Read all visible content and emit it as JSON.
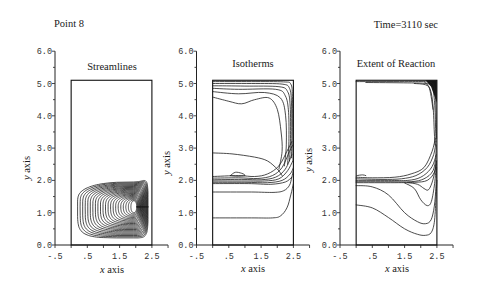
{
  "header": {
    "point_label": "Point 8",
    "time_label": "Time=3110 sec"
  },
  "labels": {
    "x_var": "x",
    "y_var": "y",
    "axis_word": " axis"
  },
  "chart_data": [
    {
      "type": "contour",
      "title": "Streamlines",
      "xlabel": "x axis",
      "ylabel": "y axis",
      "xlim": [
        -0.5,
        3.0
      ],
      "ylim": [
        0,
        6
      ],
      "x_tick_step": 0.5,
      "y_minor_step": 0.5,
      "xticks": [
        -0.5,
        0.5,
        1.5,
        2.5
      ],
      "xtick_labels": [
        "-.5",
        ".5",
        "1.5",
        "2.5"
      ],
      "yticks": [
        0,
        1,
        2,
        3,
        4,
        5,
        6
      ],
      "ytick_labels": [
        "0.0",
        "1.0",
        "2.0",
        "3.0",
        "4.0",
        "5.0",
        "6.0"
      ],
      "grid": false,
      "domain": {
        "x": [
          0,
          2.5
        ],
        "y": [
          0,
          5.1
        ]
      },
      "contours": {
        "kind": "nested_loops",
        "count": 22,
        "center": [
          1.94,
          1.18
        ],
        "outer": {
          "left": 0.2,
          "right": 2.38,
          "bottom": 0.22,
          "top_left": 1.76,
          "top_right": 2.14
        },
        "inner": {
          "left": 1.85,
          "right": 2.03,
          "bottom": 1.0,
          "top_left": 1.37,
          "top_right": 1.37
        },
        "outer_exponent": 5,
        "inner_exponent": 2.2
      }
    },
    {
      "type": "contour",
      "title": "Isotherms",
      "xlabel": "x axis",
      "ylabel": "y axis",
      "xlim": [
        -0.5,
        3.0
      ],
      "ylim": [
        0,
        6
      ],
      "x_tick_step": 0.5,
      "y_minor_step": 0.5,
      "xticks": [
        -0.5,
        0.5,
        1.5,
        2.5
      ],
      "xtick_labels": [
        "-.5",
        ".5",
        "1.5",
        "2.5"
      ],
      "yticks": [
        0,
        1,
        2,
        3,
        4,
        5,
        6
      ],
      "ytick_labels": [
        "0.0",
        "1.0",
        "2.0",
        "3.0",
        "4.0",
        "5.0",
        "6.0"
      ],
      "grid": false,
      "domain": {
        "x": [
          0,
          2.5
        ],
        "y": [
          0,
          5.1
        ]
      },
      "contours": {
        "kind": "polylines",
        "lines": [
          [
            [
              0,
              5.06
            ],
            [
              1.2,
              5.06
            ],
            [
              2.2,
              5.05
            ],
            [
              2.42,
              4.98
            ],
            [
              2.47,
              4.6
            ],
            [
              2.48,
              3.5
            ],
            [
              2.49,
              2.6
            ]
          ],
          [
            [
              0,
              5.0
            ],
            [
              1.2,
              5.0
            ],
            [
              2.15,
              4.98
            ],
            [
              2.38,
              4.85
            ],
            [
              2.44,
              4.4
            ],
            [
              2.45,
              3.4
            ],
            [
              2.44,
              2.7
            ]
          ],
          [
            [
              0,
              4.93
            ],
            [
              1.0,
              4.92
            ],
            [
              2.05,
              4.9
            ],
            [
              2.32,
              4.75
            ],
            [
              2.4,
              4.3
            ],
            [
              2.41,
              3.3
            ],
            [
              2.38,
              2.6
            ]
          ],
          [
            [
              0,
              4.85
            ],
            [
              0.8,
              4.82
            ],
            [
              1.95,
              4.82
            ],
            [
              2.25,
              4.62
            ],
            [
              2.35,
              4.1
            ],
            [
              2.36,
              3.2
            ],
            [
              2.32,
              2.5
            ]
          ],
          [
            [
              0,
              4.75
            ],
            [
              0.8,
              4.68
            ],
            [
              1.6,
              4.72
            ],
            [
              2.1,
              4.55
            ],
            [
              2.26,
              4.0
            ],
            [
              2.28,
              3.1
            ],
            [
              2.22,
              2.45
            ]
          ],
          [
            [
              0,
              4.58
            ],
            [
              0.5,
              4.45
            ],
            [
              0.9,
              4.37
            ],
            [
              1.3,
              4.5
            ],
            [
              1.75,
              4.55
            ],
            [
              2.0,
              4.2
            ],
            [
              2.12,
              3.5
            ],
            [
              2.15,
              2.9
            ],
            [
              2.05,
              2.35
            ]
          ],
          [
            [
              0,
              2.85
            ],
            [
              0.6,
              2.82
            ],
            [
              1.3,
              2.72
            ],
            [
              1.7,
              2.6
            ],
            [
              2.0,
              2.35
            ],
            [
              2.15,
              2.15
            ]
          ],
          [
            [
              0,
              2.12
            ],
            [
              0.8,
              2.15
            ],
            [
              1.3,
              2.12
            ],
            [
              1.7,
              2.2
            ],
            [
              2.05,
              2.45
            ],
            [
              2.3,
              2.9
            ],
            [
              2.45,
              3.2
            ]
          ],
          [
            [
              0,
              2.07
            ],
            [
              0.8,
              2.08
            ],
            [
              1.4,
              2.06
            ],
            [
              1.85,
              2.15
            ],
            [
              2.15,
              2.4
            ],
            [
              2.38,
              2.9
            ],
            [
              2.48,
              3.1
            ]
          ],
          [
            [
              0,
              2.02
            ],
            [
              0.9,
              2.03
            ],
            [
              1.5,
              2.02
            ],
            [
              1.95,
              2.1
            ],
            [
              2.25,
              2.35
            ],
            [
              2.45,
              2.8
            ]
          ],
          [
            [
              0,
              1.98
            ],
            [
              1.0,
              1.98
            ],
            [
              1.6,
              1.98
            ],
            [
              2.05,
              2.05
            ],
            [
              2.32,
              2.3
            ],
            [
              2.48,
              2.6
            ]
          ],
          [
            [
              0,
              1.94
            ],
            [
              1.0,
              1.94
            ],
            [
              1.7,
              1.93
            ],
            [
              2.15,
              2.0
            ],
            [
              2.4,
              2.2
            ],
            [
              2.5,
              2.4
            ]
          ],
          [
            [
              0,
              1.9
            ],
            [
              1.1,
              1.9
            ],
            [
              1.8,
              1.88
            ],
            [
              2.25,
              1.95
            ],
            [
              2.45,
              2.1
            ]
          ],
          [
            [
              0.55,
              2.15
            ],
            [
              0.7,
              2.25
            ],
            [
              0.9,
              2.22
            ],
            [
              1.0,
              2.15
            ],
            [
              0.75,
              2.13
            ],
            [
              0.55,
              2.15
            ]
          ],
          [
            [
              0,
              1.64
            ],
            [
              1.2,
              1.64
            ],
            [
              1.9,
              1.63
            ],
            [
              2.2,
              1.68
            ],
            [
              2.38,
              1.85
            ],
            [
              2.45,
              2.1
            ],
            [
              2.5,
              2.3
            ]
          ],
          [
            [
              0,
              0.84
            ],
            [
              1.2,
              0.84
            ],
            [
              1.85,
              0.84
            ],
            [
              2.1,
              0.9
            ],
            [
              2.3,
              1.15
            ],
            [
              2.42,
              1.55
            ],
            [
              2.5,
              1.9
            ]
          ]
        ]
      }
    },
    {
      "type": "contour",
      "title": "Extent of Reaction",
      "xlabel": "x axis",
      "ylabel": "y axis",
      "xlim": [
        -0.5,
        3.0
      ],
      "ylim": [
        0,
        6
      ],
      "x_tick_step": 0.5,
      "y_minor_step": 0.5,
      "xticks": [
        -0.5,
        0.5,
        1.5,
        2.5
      ],
      "xtick_labels": [
        "-.5",
        ".5",
        "1.5",
        "2.5"
      ],
      "yticks": [
        0,
        1,
        2,
        3,
        4,
        5,
        6
      ],
      "ytick_labels": [
        "0.0",
        "1.0",
        "2.0",
        "3.0",
        "4.0",
        "5.0",
        "6.0"
      ],
      "grid": false,
      "domain": {
        "x": [
          0,
          2.5
        ],
        "y": [
          0,
          5.1
        ]
      },
      "contours": {
        "kind": "polylines",
        "fills": [
          [
            [
              2.15,
              5.1
            ],
            [
              2.5,
              5.1
            ],
            [
              2.5,
              4.4
            ],
            [
              2.43,
              4.6
            ],
            [
              2.32,
              4.9
            ]
          ]
        ],
        "lines": [
          [
            [
              0,
              5.06
            ],
            [
              1.5,
              5.06
            ],
            [
              2.2,
              5.05
            ],
            [
              2.4,
              4.95
            ],
            [
              2.46,
              4.5
            ],
            [
              2.48,
              3.8
            ],
            [
              2.49,
              3.3
            ]
          ],
          [
            [
              0.3,
              5.03
            ],
            [
              1.6,
              5.02
            ],
            [
              2.15,
              5.0
            ],
            [
              2.35,
              4.9
            ],
            [
              2.43,
              4.4
            ],
            [
              2.46,
              3.6
            ],
            [
              2.47,
              3.2
            ]
          ],
          [
            [
              1.8,
              5.0
            ],
            [
              2.15,
              4.96
            ],
            [
              2.3,
              4.8
            ],
            [
              2.38,
              4.3
            ],
            [
              2.42,
              3.5
            ],
            [
              2.44,
              3.1
            ]
          ],
          [
            [
              2.1,
              5.06
            ],
            [
              2.25,
              4.9
            ],
            [
              2.32,
              4.6
            ],
            [
              2.38,
              4.2
            ]
          ],
          [
            [
              0,
              2.1
            ],
            [
              0.5,
              2.08
            ],
            [
              1.2,
              2.1
            ],
            [
              1.7,
              2.2
            ],
            [
              2.1,
              2.4
            ],
            [
              2.35,
              2.9
            ],
            [
              2.45,
              3.3
            ]
          ],
          [
            [
              0,
              2.05
            ],
            [
              0.8,
              2.03
            ],
            [
              1.4,
              2.05
            ],
            [
              1.85,
              2.15
            ],
            [
              2.2,
              2.4
            ],
            [
              2.4,
              2.8
            ],
            [
              2.47,
              3.2
            ]
          ],
          [
            [
              0,
              2.0
            ],
            [
              1.0,
              2.0
            ],
            [
              1.6,
              2.0
            ],
            [
              2.0,
              2.1
            ],
            [
              2.3,
              2.35
            ],
            [
              2.45,
              2.7
            ],
            [
              2.48,
              3.1
            ]
          ],
          [
            [
              0,
              1.96
            ],
            [
              1.0,
              1.96
            ],
            [
              1.7,
              1.96
            ],
            [
              2.1,
              2.05
            ],
            [
              2.38,
              2.3
            ],
            [
              2.48,
              2.8
            ]
          ],
          [
            [
              0,
              1.93
            ],
            [
              1.2,
              1.93
            ],
            [
              1.8,
              1.94
            ],
            [
              2.2,
              2.0
            ],
            [
              2.42,
              2.25
            ],
            [
              2.49,
              2.6
            ]
          ],
          [
            [
              0.02,
              2.15
            ],
            [
              0.2,
              2.17
            ],
            [
              0.3,
              2.15
            ]
          ],
          [
            [
              1.6,
              1.93
            ],
            [
              1.9,
              1.88
            ],
            [
              2.1,
              1.75
            ],
            [
              2.22,
              1.7
            ],
            [
              2.32,
              1.85
            ],
            [
              2.42,
              2.2
            ],
            [
              2.48,
              2.6
            ]
          ],
          [
            [
              1.5,
              1.92
            ],
            [
              1.8,
              1.75
            ],
            [
              2.0,
              1.4
            ],
            [
              2.2,
              1.22
            ],
            [
              2.33,
              1.35
            ],
            [
              2.43,
              1.9
            ],
            [
              2.48,
              2.5
            ]
          ],
          [
            [
              0,
              1.84
            ],
            [
              0.5,
              1.8
            ],
            [
              1.0,
              1.55
            ],
            [
              1.5,
              1.0
            ],
            [
              1.9,
              0.72
            ],
            [
              2.15,
              0.66
            ],
            [
              2.32,
              0.78
            ],
            [
              2.42,
              1.2
            ],
            [
              2.47,
              1.8
            ],
            [
              2.49,
              2.4
            ]
          ],
          [
            [
              0,
              1.24
            ],
            [
              0.5,
              1.15
            ],
            [
              1.0,
              0.85
            ],
            [
              1.5,
              0.5
            ],
            [
              1.9,
              0.33
            ],
            [
              2.15,
              0.3
            ],
            [
              2.32,
              0.38
            ],
            [
              2.42,
              0.7
            ],
            [
              2.47,
              1.4
            ],
            [
              2.5,
              2.0
            ]
          ]
        ]
      }
    }
  ]
}
